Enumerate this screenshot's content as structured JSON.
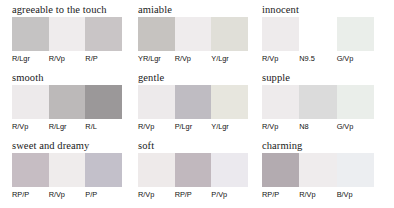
{
  "figure": {
    "background_color": "#ffffff",
    "title_color": "#1a1a1a",
    "label_color": "#111111"
  },
  "panels": [
    {
      "title": "agreeable to the touch",
      "swatches": [
        {
          "label": "R/Lgr",
          "color": "#c5c3c3"
        },
        {
          "label": "R/Vp",
          "color": "#efeced"
        },
        {
          "label": "R/P",
          "color": "#c9c5c6"
        }
      ]
    },
    {
      "title": "amiable",
      "swatches": [
        {
          "label": "YR/Lgr",
          "color": "#c6c3c0"
        },
        {
          "label": "R/Vp",
          "color": "#efeced"
        },
        {
          "label": "Y/Lgr",
          "color": "#e0dfd8"
        }
      ]
    },
    {
      "title": "innocent",
      "swatches": [
        {
          "label": "R/Vp",
          "color": "#eeebec"
        },
        {
          "label": "N9.5",
          "color": "#ffffff"
        },
        {
          "label": "G/Vp",
          "color": "#eaeeea"
        }
      ]
    },
    {
      "title": "smooth",
      "swatches": [
        {
          "label": "R/Vp",
          "color": "#edeaeb"
        },
        {
          "label": "R/Lgr",
          "color": "#bcb9b9"
        },
        {
          "label": "R/L",
          "color": "#9b9899"
        }
      ]
    },
    {
      "title": "gentle",
      "swatches": [
        {
          "label": "R/Vp",
          "color": "#edeaeb"
        },
        {
          "label": "P/Lgr",
          "color": "#bfbcc2"
        },
        {
          "label": "Y/Lgr",
          "color": "#e7e6de"
        }
      ]
    },
    {
      "title": "supple",
      "swatches": [
        {
          "label": "R/Vp",
          "color": "#eeebec"
        },
        {
          "label": "N8",
          "color": "#dbdbdb"
        },
        {
          "label": "G/Vp",
          "color": "#eaeeea"
        }
      ]
    },
    {
      "title": "sweet and dreamy",
      "swatches": [
        {
          "label": "RP/P",
          "color": "#c6bdc3"
        },
        {
          "label": "R/Vp",
          "color": "#efecec"
        },
        {
          "label": "P/P",
          "color": "#c3c0ca"
        }
      ]
    },
    {
      "title": "soft",
      "swatches": [
        {
          "label": "R/Vp",
          "color": "#eeeaea"
        },
        {
          "label": "RP/P",
          "color": "#c1b8be"
        },
        {
          "label": "P/Vp",
          "color": "#ebe9ee"
        }
      ]
    },
    {
      "title": "charming",
      "swatches": [
        {
          "label": "RP/P",
          "color": "#b3abb0"
        },
        {
          "label": "R/Vp",
          "color": "#efeced"
        },
        {
          "label": "B/Vp",
          "color": "#eceef1"
        }
      ]
    }
  ]
}
